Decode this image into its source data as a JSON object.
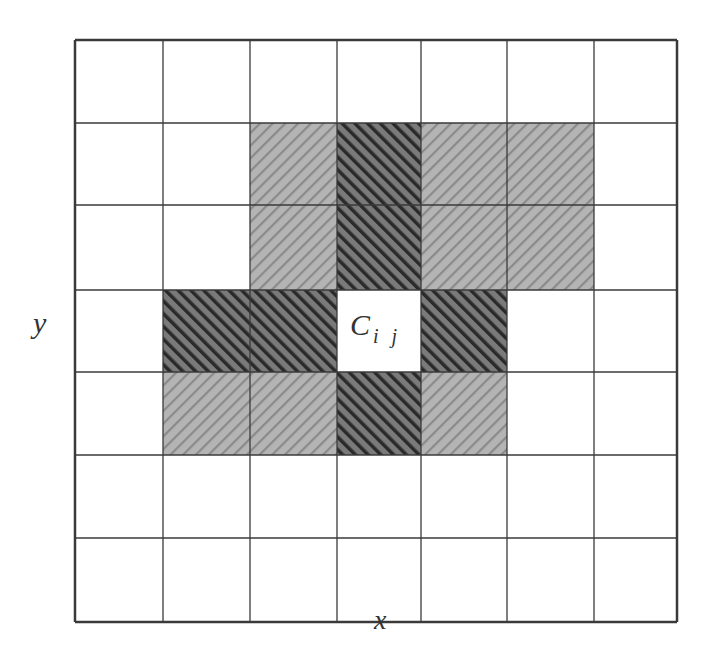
{
  "diagram": {
    "grid": {
      "rows": 7,
      "cols": 7,
      "x_lines": [
        75,
        163,
        250,
        337,
        421,
        507,
        594,
        677
      ],
      "y_lines": [
        40,
        123,
        205,
        290,
        372,
        455,
        538,
        622
      ]
    },
    "colors": {
      "line": "#3a3a3a",
      "light_fill": "#b4b4b4",
      "light_stripe": "#8a8a8a",
      "dark_fill": "#7a7a7a",
      "dark_stripe": "#2a2a2a",
      "background": "#ffffff"
    },
    "cells": [
      {
        "row": 1,
        "col": 2,
        "type": "light"
      },
      {
        "row": 1,
        "col": 3,
        "type": "dark"
      },
      {
        "row": 1,
        "col": 4,
        "type": "light"
      },
      {
        "row": 1,
        "col": 5,
        "type": "light"
      },
      {
        "row": 2,
        "col": 2,
        "type": "light"
      },
      {
        "row": 2,
        "col": 3,
        "type": "dark"
      },
      {
        "row": 2,
        "col": 4,
        "type": "light"
      },
      {
        "row": 2,
        "col": 5,
        "type": "light"
      },
      {
        "row": 3,
        "col": 1,
        "type": "dark"
      },
      {
        "row": 3,
        "col": 2,
        "type": "dark"
      },
      {
        "row": 3,
        "col": 3,
        "type": "center"
      },
      {
        "row": 3,
        "col": 4,
        "type": "dark"
      },
      {
        "row": 4,
        "col": 1,
        "type": "light"
      },
      {
        "row": 4,
        "col": 2,
        "type": "light"
      },
      {
        "row": 4,
        "col": 3,
        "type": "dark"
      },
      {
        "row": 4,
        "col": 4,
        "type": "light"
      }
    ],
    "center_label": {
      "main": "C",
      "sub": "i j"
    },
    "x_axis_label": "x",
    "y_axis_label": "y"
  }
}
